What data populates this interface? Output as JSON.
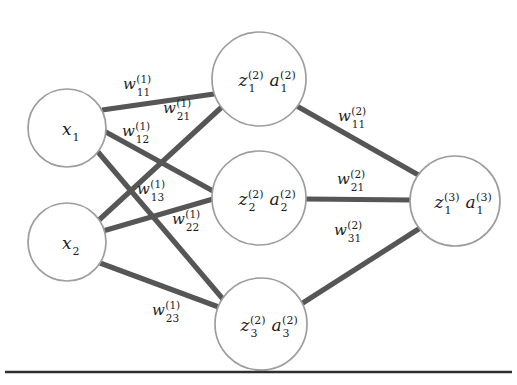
{
  "figure": {
    "colors": {
      "background": "#ffffff",
      "node_stroke": "#9d9d9d",
      "node_fill": "#ffffff",
      "edge": "#565656",
      "text": "#1d1d1d",
      "rule": "#2f2f2f"
    }
  },
  "layers": [
    {
      "name": "input-layer",
      "index": 1,
      "nodes": [
        {
          "id": "x1",
          "base": "x",
          "sub": "1",
          "sup": "",
          "second_base": "",
          "second_sub": "",
          "second_sup": "",
          "cx": 67,
          "cy": 128,
          "r": 39
        },
        {
          "id": "x2",
          "base": "x",
          "sub": "2",
          "sup": "",
          "second_base": "",
          "second_sub": "",
          "second_sup": "",
          "cx": 67,
          "cy": 242,
          "r": 39
        }
      ]
    },
    {
      "name": "hidden-layer",
      "index": 2,
      "nodes": [
        {
          "id": "h1",
          "base": "z",
          "sub": "1",
          "sup": "(2)",
          "second_base": "a",
          "second_sub": "1",
          "second_sup": "(2)",
          "cx": 259,
          "cy": 79,
          "r": 47
        },
        {
          "id": "h2",
          "base": "z",
          "sub": "2",
          "sup": "(2)",
          "second_base": "a",
          "second_sub": "2",
          "second_sup": "(2)",
          "cx": 259,
          "cy": 198,
          "r": 47
        },
        {
          "id": "h3",
          "base": "z",
          "sub": "3",
          "sup": "(2)",
          "second_base": "a",
          "second_sub": "3",
          "second_sup": "(2)",
          "cx": 261,
          "cy": 324,
          "r": 46
        }
      ]
    },
    {
      "name": "output-layer",
      "index": 3,
      "nodes": [
        {
          "id": "o1",
          "base": "z",
          "sub": "1",
          "sup": "(3)",
          "second_base": "a",
          "second_sub": "1",
          "second_sup": "(3)",
          "cx": 455,
          "cy": 201,
          "r": 45
        }
      ]
    }
  ],
  "edges": [
    {
      "id": "e-x1-h1",
      "from": "x1",
      "to": "h1",
      "x1": 102,
      "y1": 110,
      "x2": 221,
      "y2": 93
    },
    {
      "id": "e-x1-h2",
      "from": "x1",
      "to": "h2",
      "x1": 104,
      "y1": 131,
      "x2": 213,
      "y2": 191
    },
    {
      "id": "e-x1-h3",
      "from": "x1",
      "to": "h3",
      "x1": 98,
      "y1": 152,
      "x2": 228,
      "y2": 305
    },
    {
      "id": "e-x2-h1",
      "from": "x2",
      "to": "h1",
      "x1": 99,
      "y1": 220,
      "x2": 224,
      "y2": 105
    },
    {
      "id": "e-x2-h2",
      "from": "x2",
      "to": "h2",
      "x1": 103,
      "y1": 231,
      "x2": 213,
      "y2": 199
    },
    {
      "id": "e-x2-h3",
      "from": "x2",
      "to": "h3",
      "x1": 100,
      "y1": 263,
      "x2": 224,
      "y2": 309
    },
    {
      "id": "e-h1-o1",
      "from": "h1",
      "to": "o1",
      "x1": 295,
      "y1": 105,
      "x2": 429,
      "y2": 181
    },
    {
      "id": "e-h2-o1",
      "from": "h2",
      "to": "o1",
      "x1": 306,
      "y1": 199,
      "x2": 412,
      "y2": 200
    },
    {
      "id": "e-h3-o1",
      "from": "h3",
      "to": "o1",
      "x1": 298,
      "y1": 306,
      "x2": 428,
      "y2": 223
    }
  ],
  "weights": [
    {
      "id": "w11-1",
      "base": "w",
      "sub": "11",
      "sup": "(1)",
      "edge": "e-x1-h1",
      "x": 123,
      "y": 77
    },
    {
      "id": "w21-1",
      "base": "w",
      "sub": "21",
      "sup": "(1)",
      "edge": "e-x2-h1",
      "x": 163,
      "y": 101
    },
    {
      "id": "w12-1",
      "base": "w",
      "sub": "12",
      "sup": "(1)",
      "edge": "e-x1-h2",
      "x": 122,
      "y": 124
    },
    {
      "id": "w13-1",
      "base": "w",
      "sub": "13",
      "sup": "(1)",
      "edge": "e-x1-h3",
      "x": 137,
      "y": 182
    },
    {
      "id": "w22-1",
      "base": "w",
      "sub": "22",
      "sup": "(1)",
      "edge": "e-x2-h2",
      "x": 172,
      "y": 212
    },
    {
      "id": "w23-1",
      "base": "w",
      "sub": "23",
      "sup": "(1)",
      "edge": "e-x2-h3",
      "x": 152,
      "y": 303
    },
    {
      "id": "w11-2",
      "base": "w",
      "sub": "11",
      "sup": "(2)",
      "edge": "e-h1-o1",
      "x": 338,
      "y": 109
    },
    {
      "id": "w21-2",
      "base": "w",
      "sub": "21",
      "sup": "(2)",
      "edge": "e-h2-o1",
      "x": 337,
      "y": 172
    },
    {
      "id": "w31-2",
      "base": "w",
      "sub": "31",
      "sup": "(2)",
      "edge": "e-h3-o1",
      "x": 334,
      "y": 223
    }
  ],
  "rule": {
    "id": "bottom-rule",
    "x1": 5,
    "y1": 372,
    "x2": 512,
    "y2": 372
  }
}
